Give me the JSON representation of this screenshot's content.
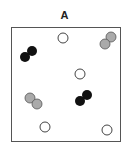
{
  "panel": {
    "label": "A"
  },
  "colors": {
    "black": "#111111",
    "gray": "#aaaaaa",
    "white": "#ffffff",
    "outline": "#444444"
  },
  "particles": [
    {
      "type": "single-white",
      "atoms": [
        {
          "cx": 63,
          "cy": 38
        }
      ]
    },
    {
      "type": "pair-gray",
      "atoms": [
        {
          "cx": 111,
          "cy": 37
        },
        {
          "cx": 105,
          "cy": 44
        }
      ]
    },
    {
      "type": "pair-black",
      "atoms": [
        {
          "cx": 32,
          "cy": 51
        },
        {
          "cx": 25,
          "cy": 57
        }
      ]
    },
    {
      "type": "single-white",
      "atoms": [
        {
          "cx": 80,
          "cy": 74
        }
      ]
    },
    {
      "type": "pair-gray",
      "atoms": [
        {
          "cx": 30,
          "cy": 98
        },
        {
          "cx": 37,
          "cy": 104
        }
      ]
    },
    {
      "type": "pair-black",
      "atoms": [
        {
          "cx": 87,
          "cy": 95
        },
        {
          "cx": 80,
          "cy": 101
        }
      ]
    },
    {
      "type": "single-white",
      "atoms": [
        {
          "cx": 45,
          "cy": 127
        }
      ]
    },
    {
      "type": "single-white",
      "atoms": [
        {
          "cx": 107,
          "cy": 130
        }
      ]
    }
  ]
}
